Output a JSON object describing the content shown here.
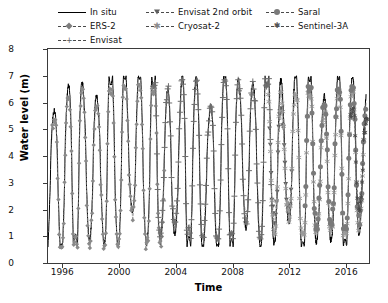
{
  "chart_data": {
    "type": "line",
    "title": "",
    "xlabel": "Time",
    "ylabel": "Water level (m)",
    "xlim": [
      1995.0,
      2017.6
    ],
    "ylim": [
      0,
      8
    ],
    "xticks": [
      1996,
      2000,
      2004,
      2008,
      2012,
      2016
    ],
    "xticklabels": [
      "1996",
      "2000",
      "2004",
      "2008",
      "2012",
      "2016"
    ],
    "yticks": [
      0,
      1,
      2,
      3,
      4,
      5,
      6,
      7,
      8
    ],
    "yticklabels": [
      "0",
      "1",
      "2",
      "3",
      "4",
      "5",
      "6",
      "7",
      "8"
    ],
    "grid": false,
    "legend_position": "above-axes",
    "series": [
      {
        "name": "In situ",
        "linestyle": "solid",
        "marker": "none",
        "color": "#000000",
        "xrange": [
          1995.0,
          2017.4
        ],
        "yrange": [
          0.6,
          7.0
        ],
        "description": "Continuous black gauge record spanning full period; strong annual cycle between about 1 m and 6.5 m"
      },
      {
        "name": "ERS-2",
        "linestyle": "dashed",
        "marker": "diamond",
        "color": "#8a8a8a",
        "xrange": [
          1995.3,
          2003.2
        ],
        "yrange": [
          0.5,
          6.7
        ],
        "description": "Altimetry, annual oscillation 0.5-6.7 m"
      },
      {
        "name": "Envisat",
        "linestyle": "dashed",
        "marker": "plus",
        "color": "#6e6e6e",
        "xrange": [
          2002.4,
          2010.8
        ],
        "yrange": [
          0.9,
          6.9
        ],
        "description": "Altimetry, annual oscillation 1-6.9 m"
      },
      {
        "name": "Envisat 2nd orbit",
        "linestyle": "dashed",
        "marker": "triangle-down",
        "color": "#5e5e5e",
        "xrange": [
          2010.6,
          2012.2
        ],
        "yrange": [
          1.4,
          5.8
        ],
        "description": "Short drifting-orbit segment"
      },
      {
        "name": "Cryosat-2",
        "linestyle": "dashed",
        "marker": "star",
        "color": "#9a9a9a",
        "xrange": [
          2010.5,
          2017.3
        ],
        "yrange": [
          1.0,
          6.4
        ],
        "description": "Altimetry, annual oscillation 1-6.4 m"
      },
      {
        "name": "Saral",
        "linestyle": "dashed",
        "marker": "circle",
        "color": "#7a7a7a",
        "xrange": [
          2013.1,
          2017.4
        ],
        "yrange": [
          1.2,
          6.6
        ],
        "description": "Altimetry with large round markers"
      },
      {
        "name": "Sentinel-3A",
        "linestyle": "dashed",
        "marker": "star-small",
        "color": "#4a4a4a",
        "xrange": [
          2016.3,
          2017.5
        ],
        "yrange": [
          1.6,
          5.9
        ],
        "description": "Short recent record"
      }
    ],
    "annual_cycle": {
      "period_years": 1.0,
      "typical_min_m": 1.0,
      "typical_max_m": 6.2,
      "note": "All sensors track the same seasonal flood pulse; peaks near year mid-point, troughs at year boundaries"
    }
  },
  "legend": {
    "items": [
      {
        "label": "In situ",
        "marker": "none",
        "linestyle": "solid"
      },
      {
        "label": "ERS-2",
        "marker": "diamond",
        "linestyle": "dashed"
      },
      {
        "label": "Envisat",
        "marker": "plus",
        "linestyle": "dashed"
      },
      {
        "label": "Envisat 2nd orbit",
        "marker": "triangle-down",
        "linestyle": "dashed"
      },
      {
        "label": "Cryosat-2",
        "marker": "star",
        "linestyle": "dashed"
      },
      {
        "label": "Saral",
        "marker": "circle",
        "linestyle": "dashed"
      },
      {
        "label": "Sentinel-3A",
        "marker": "star-small",
        "linestyle": "dashed"
      }
    ]
  },
  "colors": {
    "axis": "#3a3a3a",
    "text": "#111111",
    "in_situ": "#000000",
    "altimetry_gray": "#808080",
    "background": "#ffffff"
  }
}
